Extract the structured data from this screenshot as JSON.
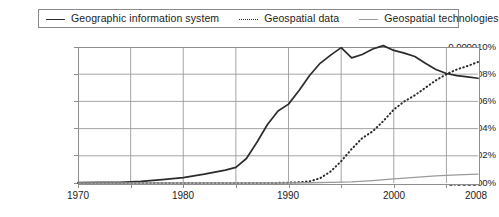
{
  "legend": {
    "position": "top",
    "entries": [
      {
        "label": "Geographic information system",
        "style": "solid",
        "icon": "line-solid-icon",
        "color": "#2b2b2b"
      },
      {
        "label": "Geospatial data",
        "style": "dotted",
        "icon": "line-dotted-icon",
        "color": "#2b2b2b"
      },
      {
        "label": "Geospatial technologies",
        "style": "thin-solid",
        "icon": "line-thin-icon",
        "color": "#9a9a9a"
      }
    ]
  },
  "axes": {
    "y_ticks": [
      "0.000010%",
      "0.000008%",
      "0.000006%",
      "0.000004%",
      "0.000002%",
      "0.000000%"
    ],
    "x_ticks": [
      "1970",
      "1980",
      "1990",
      "2000",
      "2008"
    ]
  },
  "chart_data": {
    "type": "line",
    "title": "",
    "subtitle": "",
    "xlabel": "",
    "ylabel": "",
    "xlim": [
      1970,
      2008
    ],
    "ylim": [
      0.0,
      1e-05
    ],
    "ytick_values": [
      0.0,
      2e-06,
      4e-06,
      6e-06,
      8e-06,
      1e-05
    ],
    "ytick_labels": [
      "0.000000%",
      "0.000002%",
      "0.000004%",
      "0.000006%",
      "0.000008%",
      "0.000010%"
    ],
    "xtick_values": [
      1970,
      1980,
      1990,
      2000,
      2008
    ],
    "xtick_labels": [
      "1970",
      "1980",
      "1990",
      "2000",
      "2008"
    ],
    "x_minor_gridlines": [
      1975,
      1985,
      1995,
      2005
    ],
    "grid": true,
    "legend_position": "top",
    "series": [
      {
        "name": "Geographic information system",
        "style": "solid",
        "color": "#2b2b2b",
        "x": [
          1970,
          1972,
          1974,
          1976,
          1978,
          1980,
          1982,
          1984,
          1985,
          1986,
          1987,
          1988,
          1989,
          1990,
          1991,
          1992,
          1993,
          1994,
          1995,
          1996,
          1997,
          1998,
          1999,
          2000,
          2001,
          2002,
          2003,
          2004,
          2005,
          2006,
          2007,
          2008
        ],
        "y": [
          3e-08,
          4e-08,
          5e-08,
          1.2e-07,
          2.5e-07,
          4e-07,
          6.5e-07,
          9.5e-07,
          1.15e-06,
          1.8e-06,
          3e-06,
          4.3e-06,
          5.3e-06,
          5.8e-06,
          6.8e-06,
          7.9e-06,
          8.8e-06,
          9.4e-06,
          9.95e-06,
          9.2e-06,
          9.45e-06,
          9.85e-06,
          1.01e-05,
          9.75e-06,
          9.55e-06,
          9.3e-06,
          8.8e-06,
          8.35e-06,
          8.05e-06,
          7.9e-06,
          7.8e-06,
          7.7e-06
        ]
      },
      {
        "name": "Geospatial data",
        "style": "dotted",
        "color": "#2b2b2b",
        "x": [
          1970,
          1988,
          1990,
          1991,
          1992,
          1993,
          1994,
          1995,
          1996,
          1997,
          1998,
          1999,
          2000,
          2001,
          2002,
          2003,
          2004,
          2005,
          2006,
          2007,
          2008
        ],
        "y": [
          0.0,
          0.0,
          2e-08,
          6e-08,
          1.2e-07,
          3.5e-07,
          8.5e-07,
          1.6e-06,
          2.5e-06,
          3.3e-06,
          3.8e-06,
          4.55e-06,
          5.4e-06,
          6e-06,
          6.45e-06,
          7e-06,
          7.55e-06,
          8e-06,
          8.35e-06,
          8.6e-06,
          8.9e-06
        ]
      },
      {
        "name": "Geospatial technologies",
        "style": "thin-solid",
        "color": "#9a9a9a",
        "x": [
          1970,
          1990,
          1992,
          1994,
          1996,
          1998,
          2000,
          2002,
          2004,
          2006,
          2008
        ],
        "y": [
          0.0,
          0.0,
          2e-08,
          4e-08,
          9e-08,
          1.8e-07,
          3e-07,
          4.2e-07,
          5.2e-07,
          6e-07,
          6.5e-07
        ]
      }
    ]
  }
}
